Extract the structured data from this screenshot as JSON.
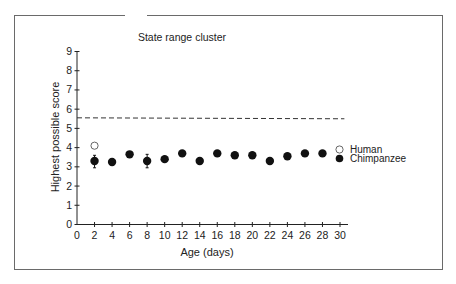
{
  "chart_data": {
    "type": "scatter",
    "title": "State  range cluster",
    "xlabel": "Age (days)",
    "ylabel": "Highest possible score",
    "xlim": [
      0,
      31
    ],
    "ylim": [
      0,
      9
    ],
    "x_ticks": [
      0,
      2,
      4,
      6,
      8,
      10,
      12,
      14,
      16,
      18,
      20,
      22,
      24,
      26,
      28,
      30
    ],
    "y_ticks": [
      0,
      1,
      2,
      3,
      4,
      5,
      6,
      7,
      8,
      9
    ],
    "grid": false,
    "legend_position": "right",
    "reference_line": {
      "style": "dashed",
      "y_start": 5.55,
      "y_end": 5.5,
      "x_start": 0,
      "x_end": 30.5
    },
    "series": [
      {
        "name": "Human",
        "marker": "open-circle",
        "points": [
          {
            "x": 2,
            "y": 4.1
          }
        ]
      },
      {
        "name": "Chimpanzee",
        "marker": "filled-circle",
        "points": [
          {
            "x": 2,
            "y": 3.3,
            "err_low": 2.95,
            "err_high": 3.6
          },
          {
            "x": 4,
            "y": 3.25
          },
          {
            "x": 6,
            "y": 3.65
          },
          {
            "x": 8,
            "y": 3.3,
            "err_low": 2.95,
            "err_high": 3.65
          },
          {
            "x": 10,
            "y": 3.4
          },
          {
            "x": 12,
            "y": 3.7
          },
          {
            "x": 14,
            "y": 3.3
          },
          {
            "x": 16,
            "y": 3.7
          },
          {
            "x": 18,
            "y": 3.6
          },
          {
            "x": 20,
            "y": 3.6
          },
          {
            "x": 22,
            "y": 3.3
          },
          {
            "x": 24,
            "y": 3.55
          },
          {
            "x": 26,
            "y": 3.7
          },
          {
            "x": 28,
            "y": 3.7
          }
        ]
      }
    ]
  },
  "legend": {
    "items": [
      {
        "label": "Human",
        "marker": "open-circle"
      },
      {
        "label": "Chimpanzee",
        "marker": "filled-circle"
      }
    ]
  }
}
